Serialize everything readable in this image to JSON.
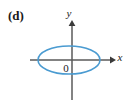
{
  "figure": {
    "part_label": "(d)",
    "origin_label": "0",
    "axis_x_label": "x",
    "axis_y_label": "y",
    "curve_name": "ellipse",
    "axis_color": "#5a5a5a",
    "curve_color": "#4a9bd1",
    "text_color": "#1a1a1a",
    "background_color": "#ffffff"
  },
  "chart_data": {
    "type": "line",
    "title": "",
    "subtitle": "",
    "xlabel": "x",
    "ylabel": "y",
    "grid": false,
    "legend": "none",
    "annotations": [
      {
        "text": "(d)",
        "position": "top-left"
      },
      {
        "text": "0",
        "position": "origin"
      }
    ],
    "axes": {
      "origin_px": {
        "x": 72,
        "y": 60
      },
      "x_axis_px": {
        "start_x": 30,
        "end_x": 114,
        "y": 60,
        "arrow": "right"
      },
      "y_axis_px": {
        "x": 72,
        "start_y": 22,
        "end_y": 100,
        "arrow": "up"
      },
      "xlim": [
        -3.5,
        3.5
      ],
      "ylim": [
        -3.2,
        3.2
      ],
      "tick_labels_x": [],
      "tick_labels_y": []
    },
    "series": [
      {
        "name": "ellipse",
        "kind": "ellipse",
        "color": "#4a9bd1",
        "linewidth": 1.6,
        "center_px": {
          "x": 69,
          "y": 60
        },
        "radius_px": {
          "rx": 31,
          "ry": 14
        },
        "center_data": {
          "x": -0.12,
          "y": 0.0
        },
        "semi_axes_data": {
          "a": 1.3,
          "b": 0.7
        },
        "closed": true
      }
    ]
  }
}
